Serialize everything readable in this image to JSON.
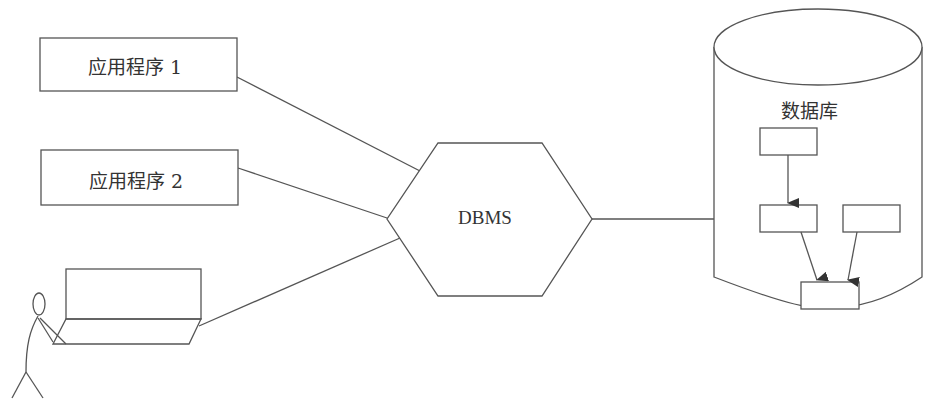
{
  "diagram": {
    "apps": [
      {
        "label": "应用程序 1"
      },
      {
        "label": "应用程序 2"
      }
    ],
    "user_terminal": {
      "label": ""
    },
    "dbms": {
      "label": "DBMS"
    },
    "database": {
      "label": "数据库"
    },
    "colors": {
      "stroke": "#555555",
      "text": "#333333",
      "background": "#ffffff"
    }
  }
}
